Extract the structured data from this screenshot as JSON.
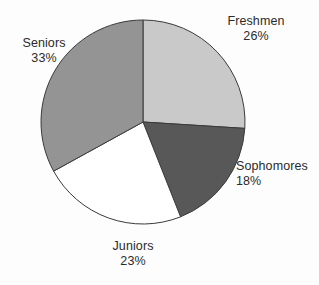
{
  "chart_data": {
    "type": "pie",
    "title": "",
    "subtitle": "",
    "xlabel": "",
    "ylabel": "",
    "legend_position": "none",
    "grid": false,
    "start_angle_deg": 0,
    "direction": "clockwise",
    "categories": [
      "Freshmen",
      "Sophomores",
      "Juniors",
      "Seniors"
    ],
    "values": [
      26,
      18,
      23,
      33
    ],
    "value_unit": "%",
    "slices": [
      {
        "label": "Freshmen",
        "percent_text": "26%",
        "value": 26,
        "color": "#c9c9c9",
        "angle_deg": 93.6,
        "start_deg": 0,
        "end_deg": 93.6
      },
      {
        "label": "Sophomores",
        "percent_text": "18%",
        "value": 18,
        "color": "#585858",
        "angle_deg": 64.8,
        "start_deg": 93.6,
        "end_deg": 158.4
      },
      {
        "label": "Juniors",
        "percent_text": "23%",
        "value": 23,
        "color": "#ffffff",
        "angle_deg": 82.8,
        "start_deg": 158.4,
        "end_deg": 241.2
      },
      {
        "label": "Seniors",
        "percent_text": "33%",
        "value": 33,
        "color": "#949494",
        "angle_deg": 118.8,
        "start_deg": 241.2,
        "end_deg": 360
      }
    ],
    "geometry": {
      "center_x": 143,
      "center_y": 122,
      "radius": 102
    },
    "style": {
      "background": "#fdfdfd",
      "outline_color": "#3a3a3a",
      "outline_width": 1,
      "label_color": "#2b2b2b"
    }
  }
}
